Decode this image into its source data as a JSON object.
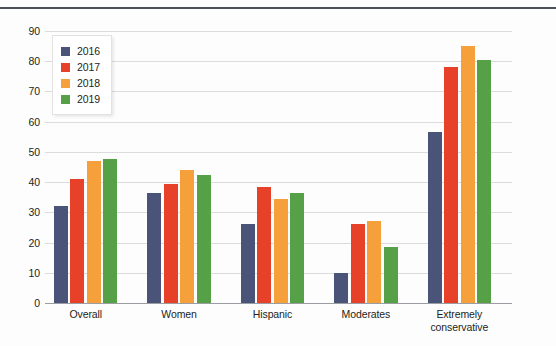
{
  "chart_data": {
    "type": "bar",
    "title": "",
    "subtitle": "",
    "xlabel": "",
    "ylabel": "",
    "categories": [
      "Overall",
      "Women",
      "Hispanic",
      "Moderates",
      "Extremely\nconservative"
    ],
    "category_lines": [
      [
        "Overall"
      ],
      [
        "Women"
      ],
      [
        "Hispanic"
      ],
      [
        "Moderates"
      ],
      [
        "Extremely",
        "conservative"
      ]
    ],
    "series": [
      {
        "name": "2016",
        "color": "#4a5478",
        "values": [
          32,
          36.5,
          26,
          10,
          56.5
        ]
      },
      {
        "name": "2017",
        "color": "#e8412a",
        "values": [
          41,
          39.5,
          38.5,
          26,
          78
        ]
      },
      {
        "name": "2018",
        "color": "#f6a03b",
        "values": [
          47,
          44,
          34.5,
          27,
          85
        ]
      },
      {
        "name": "2019",
        "color": "#56a047",
        "values": [
          47.5,
          42.5,
          36.5,
          18.5,
          80.5
        ]
      }
    ],
    "ylim": [
      0,
      90
    ],
    "ytick_step": 10,
    "yticks": [
      0,
      10,
      20,
      30,
      40,
      50,
      60,
      70,
      80,
      90
    ],
    "ytick_labels": [
      "0",
      "10",
      "20",
      "30",
      "40",
      "50",
      "60",
      "70",
      "80",
      "90"
    ],
    "grid": true,
    "grid_color": "#dcdcdc",
    "axis_color": "#9a9ea3",
    "legend_position": "upper-left-inside",
    "legend_entries": [
      "2016",
      "2017",
      "2018",
      "2019"
    ],
    "background_color": "#fdfdfd",
    "top_rule_color": "#4b5157"
  }
}
